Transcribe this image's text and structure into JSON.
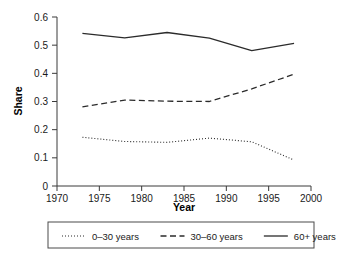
{
  "chart_data": {
    "type": "line",
    "title": "",
    "xlabel": "Year",
    "ylabel": "Share",
    "xlim": [
      1970,
      2000
    ],
    "ylim": [
      0,
      0.6
    ],
    "grid": false,
    "legend_position": "bottom",
    "x_ticks": [
      1970,
      1975,
      1980,
      1985,
      1990,
      1995,
      2000
    ],
    "x_tick_labels": [
      "1970",
      "1975",
      "1980",
      "1985",
      "1990",
      "1995",
      "2000"
    ],
    "y_ticks": [
      0,
      0.1,
      0.2,
      0.3,
      0.4,
      0.5,
      0.6
    ],
    "y_tick_labels": [
      "0",
      "0.1",
      "0.2",
      "0.3",
      "0.4",
      "0.5",
      "0.6"
    ],
    "x": [
      1973,
      1978,
      1983,
      1988,
      1993,
      1998
    ],
    "series": [
      {
        "name": "0–30 years",
        "style": "dotted",
        "color": "#2b2b2b",
        "values": [
          0.173,
          0.158,
          0.155,
          0.17,
          0.157,
          0.092
        ]
      },
      {
        "name": "30–60 years",
        "style": "dashed",
        "color": "#2b2b2b",
        "values": [
          0.281,
          0.305,
          0.301,
          0.3,
          0.345,
          0.397
        ]
      },
      {
        "name": "60+ years",
        "style": "solid",
        "color": "#2b2b2b",
        "values": [
          0.542,
          0.526,
          0.545,
          0.525,
          0.481,
          0.506
        ]
      }
    ]
  },
  "legend": {
    "entries": [
      {
        "label": "0–30 years",
        "style": "dotted"
      },
      {
        "label": "30–60 years",
        "style": "dashed"
      },
      {
        "label": "60+ years",
        "style": "solid"
      }
    ]
  }
}
